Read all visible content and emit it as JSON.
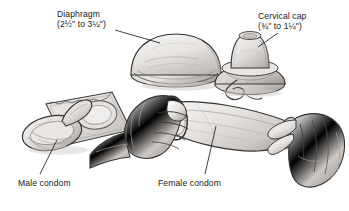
{
  "figure": {
    "kind": "medical-illustration",
    "style": "grayscale pencil line drawing",
    "width": 349,
    "height": 211,
    "background_color": "#ffffff",
    "ink_color": "#2b2b2b",
    "shade_light": "#eceae8",
    "shade_mid": "#cfcbc7",
    "shade_dark": "#a9a4a0"
  },
  "labels": {
    "diaphragm": {
      "name": "Diaphragm",
      "size_line": "(2½\" to 3¼\")",
      "size_from": "2½\"",
      "size_to": "3¼\""
    },
    "cervical_cap": {
      "name": "Cervical cap",
      "size_line": "(¾\" to 1¼\")",
      "size_from": "¾\"",
      "size_to": "1¼\""
    },
    "male_condom": {
      "name": "Male condom"
    },
    "female_condom": {
      "name": "Female condom"
    }
  },
  "illustration_items": [
    {
      "id": "diaphragm",
      "label": "Diaphragm",
      "description": "Shallow flexible dome with a thickened circular rim, shown resting rim-down",
      "position": "upper center"
    },
    {
      "id": "cervical-cap",
      "label": "Cervical cap",
      "description": "Small thimble-shaped cap seated on a wider flared base ring with a removal loop/string curling out to the lower left",
      "position": "upper right"
    },
    {
      "id": "male-condom",
      "label": "Male condom",
      "description": "Rolled latex condom with reservoir tip in front of an opened square foil wrapper",
      "position": "lower left"
    },
    {
      "id": "female-condom",
      "label": "Female condom",
      "description": "Two hands holding a wide tubular pouch with an inner flexible ring at the open end; left hand grips the ringed end, right hand pinches the far end",
      "position": "center right"
    }
  ]
}
